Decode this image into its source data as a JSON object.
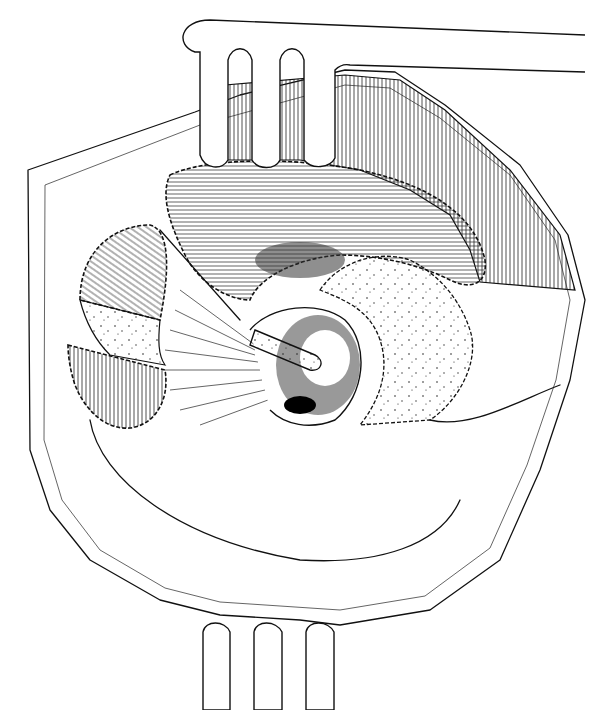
{
  "figure": {
    "type": "surgical-anatomical-line-drawing",
    "style": "black ink on white",
    "colors": {
      "ink": "#111111",
      "background": "#ffffff"
    },
    "labels": [],
    "elements": [
      {
        "name": "upper-retractor",
        "description": "three-pronged retractor entering from top"
      },
      {
        "name": "lower-retractor",
        "description": "three-pronged retractor entering from bottom"
      },
      {
        "name": "outer-tissue-boundary",
        "description": "outer border of exposed field with speckled tissue"
      },
      {
        "name": "upper-muscle-flap",
        "description": "fibrous muscle layer retracted upward with stitched edge"
      },
      {
        "name": "left-divided-flap",
        "description": "oval divided flap with stitched border on left"
      },
      {
        "name": "central-cavity",
        "description": "dark central pit with probe inserted"
      },
      {
        "name": "probe",
        "description": "dotted probe/instrument entering cavity"
      },
      {
        "name": "fan-fibers",
        "description": "radiating fibers converging on cavity"
      }
    ]
  }
}
